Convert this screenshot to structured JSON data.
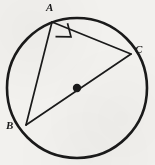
{
  "figure": {
    "kind": "circle-geometry-diagram",
    "background_color": "#f2f1ee",
    "stroke_color": "#1a1a1a",
    "width": 155,
    "height": 165
  },
  "circle": {
    "name": "circumscribed-circle",
    "center_x": 77,
    "center_y": 88,
    "radius": 70,
    "stroke_width": 2.6,
    "fill": "none"
  },
  "center_point": {
    "label": "",
    "x": 77,
    "y": 88,
    "radius": 4.2,
    "fill": "#1a1a1a"
  },
  "vertices": [
    {
      "id": "A",
      "label": "A",
      "x": 52,
      "y": 22,
      "label_x": 46,
      "label_y": 2
    },
    {
      "id": "B",
      "label": "B",
      "x": 26,
      "y": 125,
      "label_x": 6,
      "label_y": 120
    },
    {
      "id": "C",
      "label": "C",
      "x": 131,
      "y": 54,
      "label_x": 135,
      "label_y": 44
    }
  ],
  "segments": [
    {
      "id": "AB",
      "name": "segment-ab",
      "x1": 52,
      "y1": 22,
      "x2": 26,
      "y2": 125,
      "stroke_width": 1.7
    },
    {
      "id": "AC",
      "name": "segment-ac",
      "x1": 52,
      "y1": 22,
      "x2": 131,
      "y2": 54,
      "stroke_width": 1.7
    },
    {
      "id": "BC",
      "name": "segment-bc-diameter",
      "x1": 26,
      "y1": 125,
      "x2": 131,
      "y2": 54,
      "stroke_width": 1.7
    }
  ],
  "right_angle_marker": {
    "at_vertex": "A",
    "name": "right-angle-mark-at-a",
    "points": "55.5,36.6 71.0,36.8 67.5,23.2",
    "stroke_width": 1.7
  },
  "chart_data": {
    "type": "diagram",
    "title": "",
    "labels": [
      "A",
      "B",
      "C"
    ]
  }
}
